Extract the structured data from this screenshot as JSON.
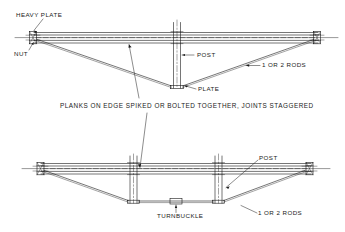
{
  "drawing": {
    "title": "Trussed plank beam details",
    "line_color": "#1a1a1a",
    "background_color": "#ffffff"
  },
  "caption": {
    "text": "PLANKS ON EDGE SPIKED OR BOLTED TOGETHER, JOINTS STAGGERED"
  },
  "top_figure": {
    "name": "king-post trussed beam",
    "labels": {
      "heavy_plate": "HEAVY PLATE",
      "nut": "NUT",
      "post": "POST",
      "plate": "PLATE",
      "rods": "1 OR 2 RODS"
    }
  },
  "bottom_figure": {
    "name": "queen-post trussed beam with turnbuckle",
    "labels": {
      "post": "POST",
      "rods": "1 OR 2 RODS",
      "turnbuckle": "TURNBUCKLE"
    }
  }
}
